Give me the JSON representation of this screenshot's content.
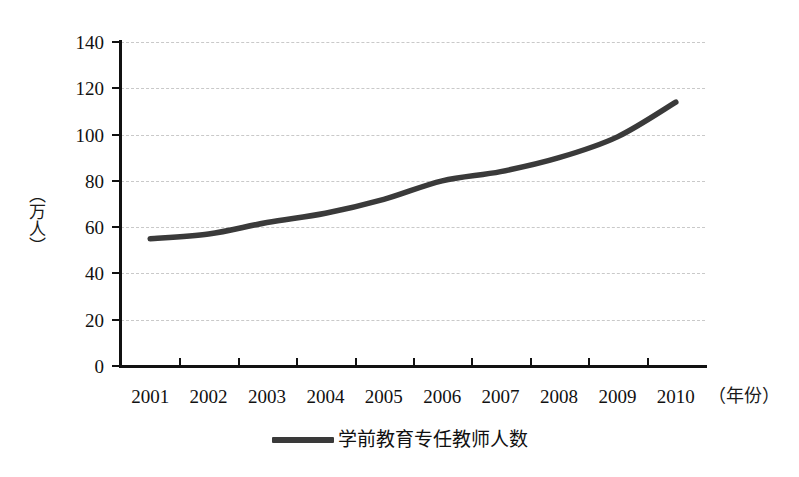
{
  "chart_data": {
    "type": "line",
    "title": "",
    "subtitle": "",
    "xlabel": "（年份）",
    "ylabel": "（万人）",
    "categories": [
      "2001",
      "2002",
      "2003",
      "2004",
      "2005",
      "2006",
      "2007",
      "2008",
      "2009",
      "2010"
    ],
    "series": [
      {
        "name": "学前教育专任教师人数",
        "color": "#3a3a3a",
        "values": [
          55,
          57,
          62,
          66,
          72,
          80,
          84,
          90,
          99,
          114
        ]
      }
    ],
    "ylim": [
      0,
      140
    ],
    "y_ticks": [
      0,
      20,
      40,
      60,
      80,
      100,
      120,
      140
    ],
    "grid": true,
    "grid_style": "dashed-horizontal",
    "legend_position": "bottom-center",
    "annotations": []
  },
  "legend": {
    "entries": [
      {
        "label": "学前教育专任教师人数",
        "swatch": "line-swatch"
      }
    ]
  },
  "axes": {
    "y_title": "（万人）",
    "x_title": "（年份）",
    "y_tick_labels": [
      "140",
      "120",
      "100",
      "80",
      "60",
      "40",
      "20",
      "0"
    ],
    "x_tick_labels": [
      "2001",
      "2002",
      "2003",
      "2004",
      "2005",
      "2006",
      "2007",
      "2008",
      "2009",
      "2010"
    ]
  }
}
